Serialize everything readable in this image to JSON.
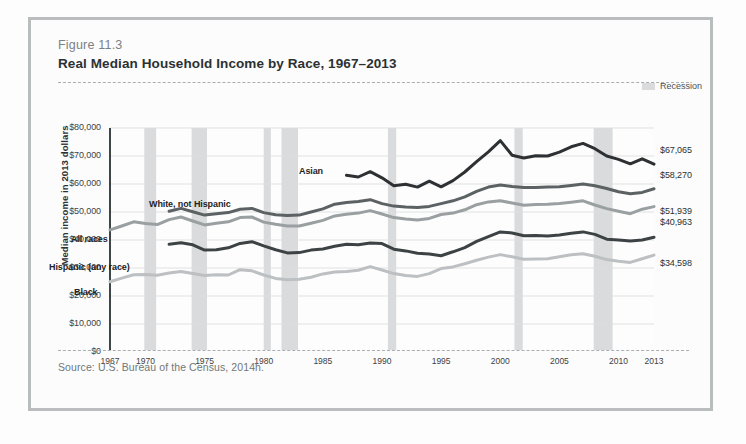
{
  "figure": {
    "number": "Figure 11.3",
    "title": "Real Median Household Income by Race, 1967–2013",
    "source": "Source: U.S. Bureau of the Census, 2014h."
  },
  "legend": {
    "recession_label": "Recession",
    "recession_color": "#d9dbdc"
  },
  "chart_data": {
    "type": "line",
    "title": "Real Median Household Income by Race, 1967–2013",
    "xlabel": "",
    "ylabel": "Median income in 2013 dollars",
    "xlim": [
      1967,
      2013
    ],
    "ylim": [
      0,
      80000
    ],
    "grid": true,
    "legend_position": "inline-labels",
    "xticks": [
      "1967",
      "1970",
      "1975",
      "1980",
      "1985",
      "1990",
      "1995",
      "2000",
      "2005",
      "2010",
      "2013"
    ],
    "xtick_values": [
      1967,
      1970,
      1975,
      1980,
      1985,
      1990,
      1995,
      2000,
      2005,
      2010,
      2013
    ],
    "yticks": [
      "$0",
      "$10,000",
      "$20,000",
      "$30,000",
      "$40,000",
      "$50,000",
      "$60,000",
      "$70,000",
      "$80,000"
    ],
    "ytick_values": [
      0,
      10000,
      20000,
      30000,
      40000,
      50000,
      60000,
      70000,
      80000
    ],
    "recession_bands": [
      [
        1969.9,
        1970.9
      ],
      [
        1973.9,
        1975.2
      ],
      [
        1980.0,
        1980.6
      ],
      [
        1981.5,
        1982.9
      ],
      [
        1990.5,
        1991.2
      ],
      [
        2001.2,
        2001.9
      ],
      [
        2007.9,
        2009.5
      ]
    ],
    "series": [
      {
        "name": "Asian",
        "label": "Asian",
        "color": "#2e3133",
        "end_value_label": "$67,065",
        "x": [
          1987,
          1988,
          1989,
          1990,
          1991,
          1992,
          1993,
          1994,
          1995,
          1996,
          1997,
          1998,
          1999,
          2000,
          2001,
          2002,
          2003,
          2004,
          2005,
          2006,
          2007,
          2008,
          2009,
          2010,
          2011,
          2012,
          2013
        ],
        "values": [
          63100,
          62500,
          64400,
          62200,
          59400,
          59900,
          58900,
          61000,
          59000,
          61200,
          64300,
          68000,
          71500,
          75500,
          70300,
          69300,
          70100,
          70000,
          71400,
          73300,
          74500,
          72600,
          70000,
          68800,
          67200,
          69000,
          67065
        ]
      },
      {
        "name": "White, not Hispanic",
        "label": "White, not Hispanic",
        "color": "#5c6163",
        "end_value_label": "$58,270",
        "x": [
          1972,
          1973,
          1974,
          1975,
          1976,
          1977,
          1978,
          1979,
          1980,
          1981,
          1982,
          1983,
          1984,
          1985,
          1986,
          1987,
          1988,
          1989,
          1990,
          1991,
          1992,
          1993,
          1994,
          1995,
          1996,
          1997,
          1998,
          1999,
          2000,
          2001,
          2002,
          2003,
          2004,
          2005,
          2006,
          2007,
          2008,
          2009,
          2010,
          2011,
          2012,
          2013
        ],
        "values": [
          50300,
          51300,
          50100,
          48900,
          49400,
          49800,
          51000,
          51300,
          49800,
          49000,
          48700,
          48900,
          50000,
          51100,
          52800,
          53400,
          53700,
          54400,
          53000,
          52100,
          51800,
          51600,
          52000,
          53000,
          54000,
          55400,
          57400,
          58900,
          59600,
          59100,
          58700,
          58800,
          58900,
          59000,
          59500,
          60000,
          59400,
          58400,
          57200,
          56500,
          57000,
          58270
        ]
      },
      {
        "name": "All races",
        "label": "All races",
        "color": "#9a9fa1",
        "end_value_label": "$51,939",
        "x": [
          1967,
          1968,
          1969,
          1970,
          1971,
          1972,
          1973,
          1974,
          1975,
          1976,
          1977,
          1978,
          1979,
          1980,
          1981,
          1982,
          1983,
          1984,
          1985,
          1986,
          1987,
          1988,
          1989,
          1990,
          1991,
          1992,
          1993,
          1994,
          1995,
          1996,
          1997,
          1998,
          1999,
          2000,
          2001,
          2002,
          2003,
          2004,
          2005,
          2006,
          2007,
          2008,
          2009,
          2010,
          2011,
          2012,
          2013
        ],
        "values": [
          43600,
          45000,
          46500,
          45900,
          45500,
          47300,
          48200,
          46800,
          45400,
          46000,
          46500,
          48000,
          48200,
          46400,
          45600,
          45000,
          45000,
          46000,
          47000,
          48600,
          49200,
          49600,
          50500,
          49300,
          48000,
          47500,
          47100,
          47700,
          49100,
          49600,
          50800,
          52600,
          53600,
          54000,
          53200,
          52400,
          52700,
          52800,
          53000,
          53500,
          54000,
          52500,
          51200,
          50300,
          49400,
          51000,
          51939
        ]
      },
      {
        "name": "Hispanic (any race)",
        "label": "Hispanic (any race)",
        "color": "#3d4244",
        "end_value_label": "$40,963",
        "x": [
          1972,
          1973,
          1974,
          1975,
          1976,
          1977,
          1978,
          1979,
          1980,
          1981,
          1982,
          1983,
          1984,
          1985,
          1986,
          1987,
          1988,
          1989,
          1990,
          1991,
          1992,
          1993,
          1994,
          1995,
          1996,
          1997,
          1998,
          1999,
          2000,
          2001,
          2002,
          2003,
          2004,
          2005,
          2006,
          2007,
          2008,
          2009,
          2010,
          2011,
          2012,
          2013
        ],
        "values": [
          38500,
          39000,
          38300,
          36400,
          36500,
          37200,
          38800,
          39400,
          37900,
          36500,
          35400,
          35500,
          36400,
          36800,
          37800,
          38500,
          38300,
          38900,
          38700,
          36700,
          36100,
          35300,
          35000,
          34400,
          35800,
          37300,
          39500,
          41200,
          42900,
          42500,
          41500,
          41600,
          41400,
          41800,
          42400,
          42900,
          42000,
          40300,
          40000,
          39600,
          40000,
          40963
        ]
      },
      {
        "name": "Black",
        "label": "Black",
        "color": "#bcc0c2",
        "end_value_label": "$34,598",
        "x": [
          1967,
          1968,
          1969,
          1970,
          1971,
          1972,
          1973,
          1974,
          1975,
          1976,
          1977,
          1978,
          1979,
          1980,
          1981,
          1982,
          1983,
          1984,
          1985,
          1986,
          1987,
          1988,
          1989,
          1990,
          1991,
          1992,
          1993,
          1994,
          1995,
          1996,
          1997,
          1998,
          1999,
          2000,
          2001,
          2002,
          2003,
          2004,
          2005,
          2006,
          2007,
          2008,
          2009,
          2010,
          2011,
          2012,
          2013
        ],
        "values": [
          25100,
          26400,
          27600,
          27700,
          27400,
          28200,
          28700,
          28000,
          27300,
          27600,
          27500,
          29400,
          29000,
          27500,
          26300,
          25800,
          26000,
          26700,
          27900,
          28600,
          28800,
          29200,
          30500,
          29300,
          28000,
          27300,
          27000,
          28000,
          29800,
          30400,
          31500,
          32800,
          33900,
          34800,
          34000,
          33100,
          33200,
          33300,
          34000,
          34700,
          35100,
          34200,
          33000,
          32400,
          32000,
          33300,
          34598
        ]
      }
    ]
  }
}
